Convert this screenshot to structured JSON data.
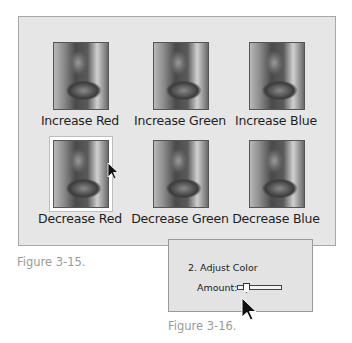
{
  "figure1": {
    "caption": "Figure 3-15.",
    "options": [
      {
        "label": "Increase Red",
        "selected": false
      },
      {
        "label": "Increase Green",
        "selected": false
      },
      {
        "label": "Increase Blue",
        "selected": false
      },
      {
        "label": "Decrease Red",
        "selected": true
      },
      {
        "label": "Decrease Green",
        "selected": false
      },
      {
        "label": "Decrease Blue",
        "selected": false
      }
    ]
  },
  "figure2": {
    "caption": "Figure 3-16.",
    "step_title": "2. Adjust Color",
    "amount_label": "Amount:",
    "slider": {
      "value_position": "low"
    }
  },
  "icons": {
    "cursor": "arrow-cursor-icon"
  }
}
